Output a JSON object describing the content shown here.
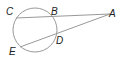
{
  "diagram": {
    "type": "circle-with-two-secants",
    "colors": {
      "stroke": "#999999",
      "label": "#222222",
      "background": "#ffffff"
    },
    "circle": {
      "cx": 35,
      "cy": 30,
      "r": 22
    },
    "points": {
      "A": {
        "label": "A",
        "x": 110,
        "y": 14
      },
      "B": {
        "label": "B",
        "x": 53,
        "y": 16
      },
      "C": {
        "label": "C",
        "x": 16,
        "y": 18
      },
      "D": {
        "label": "D",
        "x": 55,
        "y": 37
      },
      "E": {
        "label": "E",
        "x": 20,
        "y": 47
      }
    },
    "segments": [
      {
        "from": "C",
        "to": "A"
      },
      {
        "from": "E",
        "to": "A"
      }
    ]
  }
}
